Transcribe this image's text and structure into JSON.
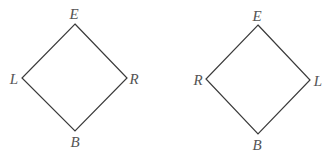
{
  "diagrams": [
    {
      "name": "left-lattice",
      "labels": {
        "top": "E",
        "left": "L",
        "right": "R",
        "bottom": "B"
      }
    },
    {
      "name": "right-lattice",
      "labels": {
        "top": "E",
        "left": "R",
        "right": "L",
        "bottom": "B"
      }
    }
  ],
  "colors": {
    "line": "#3a3a3a",
    "text": "#555555"
  }
}
